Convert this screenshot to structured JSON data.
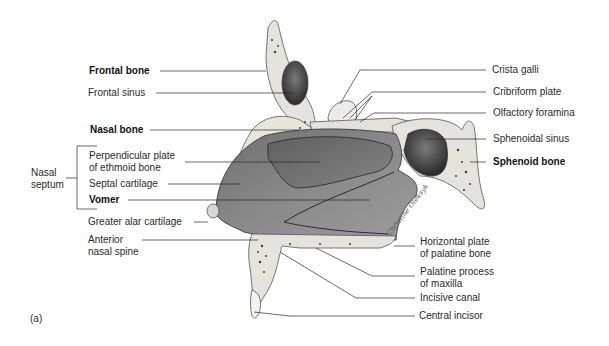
{
  "figure": {
    "panel_label": "(a)",
    "signature": "Christine Oleksyk",
    "left_labels": [
      {
        "id": "frontal-bone",
        "text": "Frontal bone",
        "bold": true
      },
      {
        "id": "frontal-sinus",
        "text": "Frontal sinus",
        "bold": false
      },
      {
        "id": "nasal-bone",
        "text": "Nasal bone",
        "bold": true
      },
      {
        "id": "perpendicular-plate",
        "line1": "Perpendicular plate",
        "line2": "of ethmoid bone",
        "bold": false
      },
      {
        "id": "septal-cartilage",
        "text": "Septal cartilage",
        "bold": false
      },
      {
        "id": "vomer",
        "text": "Vomer",
        "bold": true
      },
      {
        "id": "greater-alar-cartilage",
        "text": "Greater alar cartilage",
        "bold": false
      },
      {
        "id": "anterior-nasal-spine",
        "line1": "Anterior",
        "line2": "nasal spine",
        "bold": false
      }
    ],
    "bracket_label": {
      "line1": "Nasal",
      "line2": "septum"
    },
    "right_labels": [
      {
        "id": "crista-galli",
        "text": "Crista galli",
        "bold": false
      },
      {
        "id": "cribriform-plate",
        "text": "Cribriform plate",
        "bold": false
      },
      {
        "id": "olfactory-foramina",
        "text": "Olfactory foramina",
        "bold": false
      },
      {
        "id": "sphenoidal-sinus",
        "text": "Sphenoidal sinus",
        "bold": false
      },
      {
        "id": "sphenoid-bone",
        "text": "Sphenoid bone",
        "bold": true
      },
      {
        "id": "horizontal-plate",
        "line1": "Horizontal plate",
        "line2": "of palatine bone",
        "bold": false
      },
      {
        "id": "palatine-process",
        "line1": "Palatine process",
        "line2": "of maxilla",
        "bold": false
      },
      {
        "id": "incisive-canal",
        "text": "Incisive canal",
        "bold": false
      },
      {
        "id": "central-incisor",
        "text": "Central incisor",
        "bold": false
      }
    ]
  }
}
